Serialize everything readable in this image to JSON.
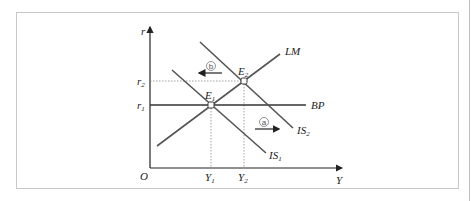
{
  "diagram": {
    "type": "IS-LM-BP",
    "axes": {
      "x_label": "Y",
      "y_label": "r",
      "origin_label": "O"
    },
    "curves": [
      {
        "name": "LM",
        "label": "LM"
      },
      {
        "name": "BP",
        "label": "BP"
      },
      {
        "name": "IS1",
        "label_main": "IS",
        "label_sub": "1"
      },
      {
        "name": "IS2",
        "label_main": "IS",
        "label_sub": "2"
      }
    ],
    "points": [
      {
        "name": "E1",
        "label_main": "E",
        "label_sub": "1"
      },
      {
        "name": "E2",
        "label_main": "E",
        "label_sub": "2"
      }
    ],
    "ticks": {
      "r1": {
        "main": "r",
        "sub": "1"
      },
      "r2": {
        "main": "r",
        "sub": "2"
      },
      "Y1": {
        "main": "Y",
        "sub": "1"
      },
      "Y2": {
        "main": "Y",
        "sub": "2"
      }
    },
    "arrows": [
      {
        "name": "a",
        "marker": "ⓐ",
        "direction": "right"
      },
      {
        "name": "b",
        "marker": "ⓑ",
        "direction": "left"
      }
    ],
    "colors": {
      "axis": "#222222",
      "curve": "#555555",
      "bp": "#333333",
      "guide": "#888888",
      "frame": "#c8c8c8"
    }
  }
}
